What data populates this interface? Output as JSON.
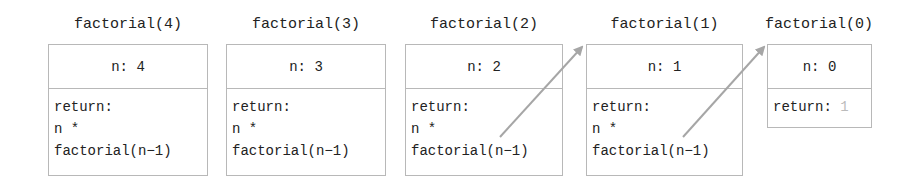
{
  "frames": [
    {
      "title": "factorial(4)",
      "n_label": "n: 4",
      "return_lines": [
        "return:",
        "n *",
        "factorial(n−1)"
      ]
    },
    {
      "title": "factorial(3)",
      "n_label": "n: 3",
      "return_lines": [
        "return:",
        "n *",
        "factorial(n−1)"
      ]
    },
    {
      "title": "factorial(2)",
      "n_label": "n: 2",
      "return_lines": [
        "return:",
        "n *",
        "factorial(n−1)"
      ]
    },
    {
      "title": "factorial(1)",
      "n_label": "n: 1",
      "return_lines": [
        "return:",
        "n *",
        "factorial(n−1)"
      ]
    },
    {
      "title": "factorial(0)",
      "n_label": "n: 0",
      "return_label": "return:",
      "return_value": "1"
    }
  ],
  "colors": {
    "border": "#b8b8b8",
    "arrow": "#a6a6a6",
    "faded_value": "#bbbbbb"
  }
}
